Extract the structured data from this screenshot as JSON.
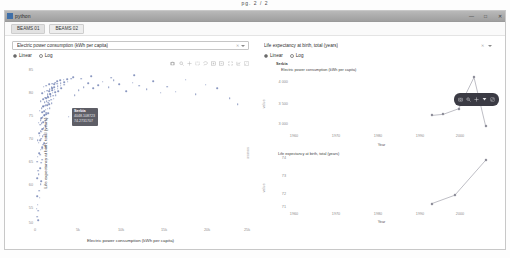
{
  "page_label": "pg. 2 / 2",
  "window": {
    "title": "python",
    "icon": "python-icon",
    "controls": {
      "minimize": "—",
      "maximize": "□",
      "close": "✕"
    }
  },
  "tabs": [
    {
      "label": "BEAMS 01",
      "active": true
    },
    {
      "label": "BEAMS 02",
      "active": false
    }
  ],
  "left_panel": {
    "dropdown": {
      "value": "Electric power consumption (kWh per capita)",
      "clear_icon": "clear-icon",
      "caret_icon": "chevron-down-icon"
    },
    "scale_radios": [
      {
        "label": "Linear",
        "selected": true
      },
      {
        "label": "Log",
        "selected": false
      }
    ],
    "modebar_icons": [
      "camera-icon",
      "zoom-icon",
      "pan-icon",
      "box-select-icon",
      "lasso-select-icon",
      "zoom-in-icon",
      "zoom-out-icon",
      "autoscale-icon",
      "reset-axes-icon",
      "plotly-logo-icon"
    ],
    "tooltip": {
      "title": "Serbia",
      "line1": "4048.108723",
      "line2": "74.2731707"
    }
  },
  "right_panel": {
    "dropdown": {
      "value": "Life expectancy at birth, total (years)",
      "clear_icon": "clear-icon",
      "caret_icon": "chevron-down-icon"
    },
    "scale_radios": [
      {
        "label": "Linear",
        "selected": true
      },
      {
        "label": "Log",
        "selected": false
      }
    ],
    "dark_modebar_icons": [
      "camera-icon",
      "zoom-icon",
      "pan-icon",
      "autoscale-icon",
      "plotly-logo-icon"
    ]
  },
  "chart_data": [
    {
      "type": "scatter",
      "title": "",
      "xlabel": "Electric power consumption (kWh per capita)",
      "ylabel": "Life expectancy at birth, total (years)",
      "right_ylabel": "source",
      "xlim": [
        0,
        25000
      ],
      "ylim": [
        50,
        85
      ],
      "xticks": [
        0,
        5000,
        10000,
        15000,
        20000,
        25000
      ],
      "xticklabels": [
        "0",
        "5k",
        "10k",
        "15k",
        "20k",
        "25k"
      ],
      "yticks": [
        50,
        55,
        60,
        65,
        70,
        75,
        80,
        85
      ],
      "yticklabels": [
        "50",
        "55",
        "60",
        "65",
        "70",
        "75",
        "80",
        "85"
      ],
      "grid": false,
      "marker_color": "#5b6fa8",
      "points": [
        [
          320,
          54.2
        ],
        [
          410,
          52.8
        ],
        [
          260,
          56.1
        ],
        [
          520,
          57.4
        ],
        [
          680,
          58.9
        ],
        [
          300,
          60.3
        ],
        [
          455,
          61.2
        ],
        [
          610,
          62.6
        ],
        [
          780,
          63.8
        ],
        [
          900,
          64.5
        ],
        [
          350,
          65.2
        ],
        [
          520,
          66.0
        ],
        [
          690,
          66.8
        ],
        [
          840,
          67.3
        ],
        [
          1010,
          67.9
        ],
        [
          430,
          68.4
        ],
        [
          600,
          68.9
        ],
        [
          760,
          69.3
        ],
        [
          930,
          69.8
        ],
        [
          1120,
          70.2
        ],
        [
          510,
          70.6
        ],
        [
          700,
          71.0
        ],
        [
          880,
          71.4
        ],
        [
          1060,
          71.8
        ],
        [
          1280,
          72.1
        ],
        [
          620,
          72.5
        ],
        [
          820,
          72.8
        ],
        [
          1000,
          73.1
        ],
        [
          1200,
          73.4
        ],
        [
          1420,
          73.7
        ],
        [
          740,
          74.0
        ],
        [
          950,
          74.3
        ],
        [
          1150,
          74.6
        ],
        [
          1380,
          74.9
        ],
        [
          1600,
          75.1
        ],
        [
          870,
          75.4
        ],
        [
          1080,
          75.6
        ],
        [
          1300,
          75.9
        ],
        [
          1550,
          76.1
        ],
        [
          1800,
          76.3
        ],
        [
          1000,
          76.6
        ],
        [
          1250,
          76.8
        ],
        [
          1480,
          77.0
        ],
        [
          1740,
          77.2
        ],
        [
          2000,
          77.4
        ],
        [
          1150,
          77.6
        ],
        [
          1400,
          77.8
        ],
        [
          1680,
          78.0
        ],
        [
          1950,
          78.2
        ],
        [
          2250,
          78.4
        ],
        [
          1320,
          78.6
        ],
        [
          1600,
          78.8
        ],
        [
          1880,
          79.0
        ],
        [
          2180,
          79.1
        ],
        [
          2500,
          79.3
        ],
        [
          1520,
          79.5
        ],
        [
          1820,
          79.6
        ],
        [
          2120,
          79.8
        ],
        [
          2450,
          79.9
        ],
        [
          2800,
          80.1
        ],
        [
          1750,
          80.2
        ],
        [
          2080,
          80.4
        ],
        [
          2400,
          80.5
        ],
        [
          2760,
          80.7
        ],
        [
          3150,
          80.8
        ],
        [
          2000,
          81.0
        ],
        [
          2350,
          81.1
        ],
        [
          2720,
          81.3
        ],
        [
          3100,
          81.4
        ],
        [
          3520,
          81.6
        ],
        [
          2300,
          81.7
        ],
        [
          2680,
          81.9
        ],
        [
          3080,
          82.0
        ],
        [
          3500,
          82.2
        ],
        [
          3950,
          82.3
        ],
        [
          2650,
          82.5
        ],
        [
          3050,
          82.6
        ],
        [
          3480,
          82.8
        ],
        [
          3920,
          82.9
        ],
        [
          4400,
          83.0
        ],
        [
          4048,
          74.3
        ],
        [
          4800,
          79.2
        ],
        [
          5300,
          80.4
        ],
        [
          5900,
          81.1
        ],
        [
          6400,
          82.0
        ],
        [
          7000,
          80.8
        ],
        [
          7600,
          81.5
        ],
        [
          8200,
          82.3
        ],
        [
          8900,
          81.0
        ],
        [
          9500,
          82.6
        ],
        [
          10200,
          81.8
        ],
        [
          11000,
          80.2
        ],
        [
          11800,
          82.1
        ],
        [
          12600,
          81.4
        ],
        [
          13500,
          80.6
        ],
        [
          14300,
          82.4
        ],
        [
          15200,
          79.8
        ],
        [
          16000,
          81.2
        ],
        [
          17000,
          80.0
        ],
        [
          18200,
          82.8
        ],
        [
          19400,
          79.4
        ],
        [
          20600,
          81.6
        ],
        [
          22000,
          80.9
        ],
        [
          23500,
          78.6
        ],
        [
          24500,
          77.2
        ],
        [
          250,
          51.4
        ],
        [
          380,
          50.6
        ],
        [
          190,
          53.3
        ],
        [
          560,
          55.8
        ],
        [
          720,
          59.6
        ],
        [
          410,
          62.0
        ],
        [
          270,
          64.0
        ],
        [
          640,
          65.6
        ],
        [
          860,
          67.0
        ],
        [
          1080,
          68.2
        ],
        [
          330,
          69.0
        ],
        [
          580,
          70.0
        ],
        [
          790,
          70.9
        ],
        [
          990,
          71.6
        ],
        [
          1240,
          72.3
        ],
        [
          470,
          72.9
        ],
        [
          680,
          73.5
        ],
        [
          900,
          74.1
        ],
        [
          1130,
          74.7
        ],
        [
          1370,
          75.2
        ],
        [
          560,
          75.7
        ],
        [
          790,
          76.2
        ],
        [
          1020,
          76.7
        ],
        [
          1290,
          77.1
        ],
        [
          1560,
          77.5
        ],
        [
          700,
          77.9
        ],
        [
          960,
          78.3
        ],
        [
          1220,
          78.7
        ],
        [
          1510,
          79.0
        ],
        [
          1820,
          79.4
        ],
        [
          860,
          79.7
        ],
        [
          1150,
          80.0
        ],
        [
          1450,
          80.3
        ],
        [
          1770,
          80.6
        ],
        [
          2100,
          80.9
        ],
        [
          1050,
          81.2
        ],
        [
          1380,
          81.4
        ],
        [
          1720,
          81.7
        ],
        [
          2080,
          81.9
        ],
        [
          2450,
          82.1
        ],
        [
          4600,
          83.4
        ],
        [
          5600,
          83.0
        ],
        [
          6800,
          83.6
        ],
        [
          9200,
          83.2
        ],
        [
          12000,
          83.8
        ]
      ]
    },
    {
      "type": "line",
      "title_country": "Serbia",
      "title_metric": "Electric power consumption (kWh per capita)",
      "xlabel": "Year",
      "ylabel": "value",
      "xlim": [
        1960,
        2014
      ],
      "ylim": [
        2500,
        5000
      ],
      "xticks": [
        1960,
        1970,
        1980,
        1990,
        2000
      ],
      "xticklabels": [
        "1960",
        "1970",
        "1980",
        "1990",
        "2000"
      ],
      "yticks": [
        3000,
        3500,
        4000
      ],
      "yticklabels": [
        "3 000",
        "3 500",
        "4 000"
      ],
      "grid": false,
      "line_color": "#7c7c8a",
      "x": [
        1997,
        2000,
        2004,
        2008,
        2011
      ],
      "y": [
        3150,
        3200,
        3450,
        4850,
        2700
      ]
    },
    {
      "type": "line",
      "title_metric": "Life expectancy at birth, total (years)",
      "xlabel": "Year",
      "ylabel": "value",
      "xlim": [
        1960,
        2014
      ],
      "ylim": [
        71,
        75
      ],
      "xticks": [
        1960,
        1970,
        1980,
        1990,
        2000
      ],
      "xticklabels": [
        "1960",
        "1970",
        "1980",
        "1990",
        "2000"
      ],
      "yticks": [
        71,
        72,
        73,
        74
      ],
      "yticklabels": [
        "71",
        "72",
        "73",
        "74"
      ],
      "grid": false,
      "line_color": "#7c7c8a",
      "x": [
        1997,
        2003,
        2011
      ],
      "y": [
        71.2,
        71.9,
        74.8
      ]
    }
  ]
}
